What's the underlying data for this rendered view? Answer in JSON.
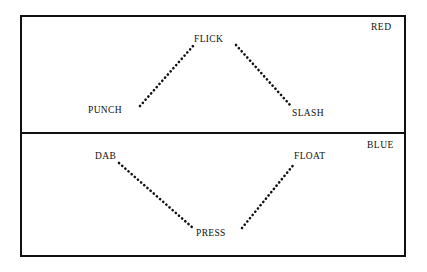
{
  "figure": {
    "background": "#ffffff",
    "stroke_color": "#111111",
    "dot_color": "#111111",
    "border_width_px": 2,
    "divider_width_px": 2,
    "outer_box": {
      "x": 21,
      "y": 16,
      "width": 384,
      "height": 240
    },
    "divider_y": 133
  },
  "panels": [
    {
      "id": "red",
      "name": "RED",
      "label": "RED",
      "label_position": "top-right",
      "shape": "peak",
      "nodes": [
        {
          "id": "punch",
          "label": "PUNCH",
          "role": "left-endpoint",
          "x": 140,
          "y": 107
        },
        {
          "id": "flick",
          "label": "FLICK",
          "role": "apex",
          "x": 214,
          "y": 45
        },
        {
          "id": "slash",
          "label": "SLASH",
          "role": "right-endpoint",
          "x": 291,
          "y": 107
        }
      ],
      "edges": [
        {
          "from": "punch",
          "to": "flick",
          "style": "dotted",
          "x1": 140,
          "y1": 106,
          "x2": 193,
          "y2": 46
        },
        {
          "from": "flick",
          "to": "slash",
          "style": "dotted",
          "x1": 236,
          "y1": 45,
          "x2": 291,
          "y2": 106
        }
      ]
    },
    {
      "id": "blue",
      "name": "BLUE",
      "label": "BLUE",
      "label_position": "top-right",
      "shape": "valley",
      "nodes": [
        {
          "id": "dab",
          "label": "DAB",
          "role": "left-endpoint",
          "x": 119,
          "y": 163
        },
        {
          "id": "press",
          "label": "PRESS",
          "role": "vertex",
          "x": 217,
          "y": 229
        },
        {
          "id": "float",
          "label": "FLOAT",
          "role": "right-endpoint",
          "x": 295,
          "y": 163
        }
      ],
      "edges": [
        {
          "from": "dab",
          "to": "press",
          "style": "dotted",
          "x1": 119,
          "y1": 163,
          "x2": 193,
          "y2": 228
        },
        {
          "from": "press",
          "to": "float",
          "style": "dotted",
          "x1": 242,
          "y1": 228,
          "x2": 295,
          "y2": 163
        }
      ]
    }
  ],
  "labels": {
    "punch": "PUNCH",
    "flick": "FLICK",
    "slash": "SLASH",
    "dab": "DAB",
    "float": "FLOAT",
    "press": "PRESS",
    "red": "RED",
    "blue": "BLUE"
  }
}
